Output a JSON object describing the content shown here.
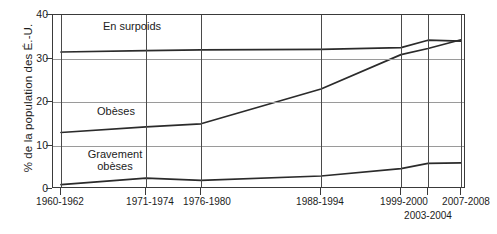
{
  "chart_data": {
    "type": "line",
    "title": "",
    "xlabel": "",
    "ylabel": "% de la population des É.-U.",
    "ylim": [
      0,
      40
    ],
    "yticks": [
      0,
      10,
      20,
      30,
      40
    ],
    "grid": true,
    "legend_position": "inline-labels",
    "categories": [
      "1960-1962",
      "1971-1974",
      "1976-1980",
      "1988-1994",
      "1999-2000",
      "2003-2004",
      "2007-2008"
    ],
    "series": [
      {
        "name": "En surpoids",
        "values": [
          31.5,
          31.8,
          32.0,
          32.1,
          32.5,
          34.2,
          34.0
        ],
        "color": "#2b2b2b"
      },
      {
        "name": "Obèses",
        "values": [
          13.0,
          14.3,
          15.0,
          23.0,
          30.9,
          32.3,
          34.3
        ],
        "color": "#2b2b2b"
      },
      {
        "name": "Gravement obèses",
        "values": [
          1.0,
          2.5,
          2.0,
          3.0,
          4.7,
          5.9,
          6.0
        ],
        "color": "#2b2b2b"
      }
    ],
    "series_labels": [
      {
        "text": "En surpoids",
        "series": "En surpoids"
      },
      {
        "text": "Obèses",
        "series": "Obèses"
      },
      {
        "text": "Gravement",
        "series": "Gravement obèses"
      },
      {
        "text": "obèses",
        "series": "Gravement obèses"
      }
    ],
    "colors": {
      "line": "#2b2b2b",
      "frame": "#3a3a3a",
      "hgrid": "#9a9a9a",
      "vgrid": "#4a4a4a",
      "background": "#ffffff",
      "text": "#1c1c1c"
    }
  }
}
